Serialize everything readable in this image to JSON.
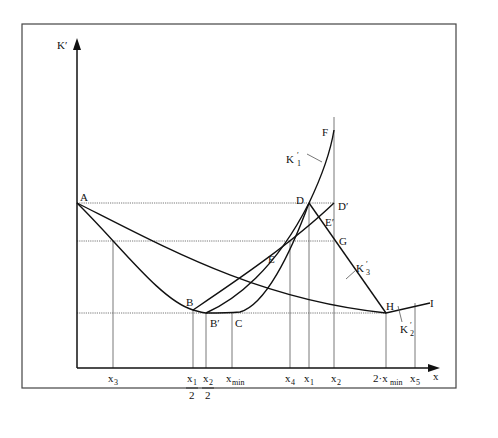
{
  "diagram": {
    "y_axis_label": "K′",
    "x_axis_label": "x",
    "points": {
      "A": "A",
      "B": "B",
      "B_prime": "B′",
      "C": "C",
      "D": "D",
      "D_prime": "D′",
      "E": "E",
      "E_prime": "E′",
      "F": "F",
      "G": "G",
      "H": "H",
      "I": "I"
    },
    "curves": {
      "k1": {
        "base": "K",
        "sup": "′",
        "sub": "1"
      },
      "k2": {
        "base": "K",
        "sup": "′",
        "sub": "2"
      },
      "k3": {
        "base": "K",
        "sup": "′",
        "sub": "3"
      }
    },
    "x_ticks": {
      "x3": {
        "base": "x",
        "sub": "3"
      },
      "x1_half": {
        "num_base": "x",
        "num_sub": "1",
        "den": "2"
      },
      "x2_half": {
        "num_base": "x",
        "num_sub": "2",
        "den": "2"
      },
      "xmin": {
        "base": "x",
        "sub": "min"
      },
      "x4": {
        "base": "x",
        "sub": "4"
      },
      "x1": {
        "base": "x",
        "sub": "1"
      },
      "x2": {
        "base": "x",
        "sub": "2"
      },
      "two_xmin": {
        "prefix": "2·x",
        "sub": "min"
      },
      "x5": {
        "base": "x",
        "sub": "5"
      }
    }
  }
}
